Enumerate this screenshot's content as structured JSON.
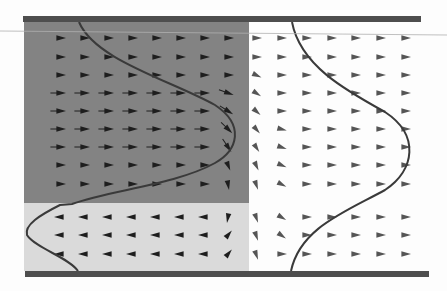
{
  "figure": {
    "width": 447,
    "height": 291,
    "colors": {
      "background": "#fdfdfd",
      "dark_region": "#838383",
      "light_region": "#dadada",
      "wall": "#4e4e4e",
      "curve": "#3a3a3a",
      "arrow_dark": "#1e1e1e",
      "arrow_light": "#555555",
      "scan_line": "#b0b0b0"
    },
    "walls": {
      "top": {
        "x": 23,
        "y": 16,
        "width": 398,
        "height": 6
      },
      "bottom": {
        "x": 25,
        "y": 271,
        "width": 404,
        "height": 6
      }
    },
    "regions": {
      "dark": {
        "x": 24,
        "y": 22,
        "width": 225,
        "height": 181
      },
      "light": {
        "x": 24,
        "y": 203,
        "width": 225,
        "height": 68
      }
    },
    "curves": {
      "left_profile": "M79,22 C95,60 170,80 215,105 C245,125 238,150 215,163 C175,185 110,190 72,204 L60,205 C40,215 24,225 27,235 C35,248 70,258 78,271",
      "right_profile": "M292,22 C300,65 345,90 385,112 C420,135 415,170 385,190 C345,212 300,228 291,271"
    },
    "arrows": {
      "columns_left": [
        60,
        84,
        108,
        132,
        156,
        180,
        204,
        228
      ],
      "columns_right": [
        256,
        281,
        306,
        331,
        355,
        380,
        405
      ],
      "rows_upper": [
        38,
        57,
        75,
        93,
        111,
        129,
        147,
        165,
        184
      ],
      "rows_lower": [
        217,
        235,
        254
      ],
      "size": 6
    }
  }
}
